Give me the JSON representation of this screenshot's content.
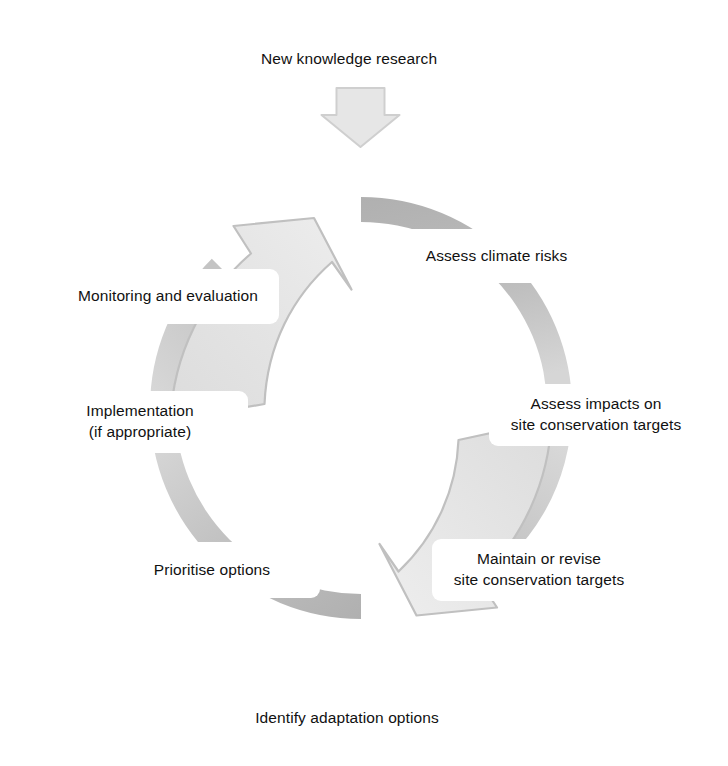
{
  "diagram": {
    "type": "cycle",
    "direction": "clockwise",
    "colors": {
      "box_fill": "#ffffff",
      "box_border": "#4a4a4a",
      "text": "#111111",
      "ring_dark": "#b3b3b3",
      "ring_mid": "#c9c9c9",
      "ring_light": "#dedede",
      "arrow_fill": "#e2e2e2",
      "arrow_stroke": "#bdbdbd",
      "background": "#ffffff"
    },
    "nodes": [
      {
        "id": "new-knowledge-research",
        "label": "New knowledge research",
        "position": "top"
      },
      {
        "id": "assess-climate-risks",
        "label": "Assess climate risks",
        "position": "upper-right"
      },
      {
        "id": "assess-impacts",
        "label": "Assess impacts on\nsite conservation targets",
        "position": "right"
      },
      {
        "id": "maintain-or-revise",
        "label": "Maintain or revise\nsite conservation targets",
        "position": "lower-right"
      },
      {
        "id": "identify-adaptation",
        "label": "Identify adaptation options",
        "position": "bottom"
      },
      {
        "id": "prioritise-options",
        "label": "Prioritise options",
        "position": "lower-left"
      },
      {
        "id": "implementation",
        "label": "Implementation\n(if appropriate)",
        "position": "left"
      },
      {
        "id": "monitoring-evaluation",
        "label": "Monitoring and evaluation",
        "position": "upper-left"
      }
    ],
    "arrows": [
      {
        "id": "feedback-down-arrow",
        "from": "new-knowledge-research",
        "to": "cycle-top",
        "shape": "down-arrow"
      },
      {
        "id": "cycle-arrow-upper-left",
        "from": "monitoring-evaluation",
        "to": "new-knowledge-research",
        "shape": "curved-arrow-up-right"
      },
      {
        "id": "cycle-arrow-lower-right",
        "from": "maintain-or-revise",
        "to": "identify-adaptation",
        "shape": "curved-arrow-down-left"
      }
    ]
  }
}
